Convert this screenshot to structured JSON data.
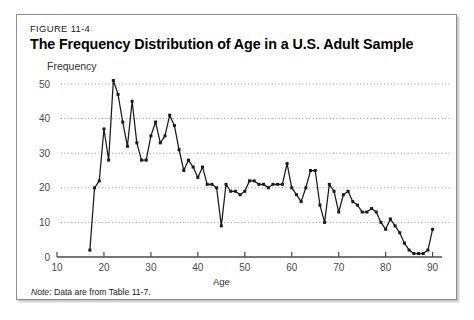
{
  "figure": {
    "number": "FIGURE 11-4",
    "title": "The Frequency Distribution of Age in a U.S. Adult Sample",
    "note_label": "Note:",
    "note_text": " Data are from Table 11-7."
  },
  "chart_data": {
    "type": "line",
    "title": "The Frequency Distribution of Age in a U.S. Adult Sample",
    "xlabel": "Age",
    "ylabel": "Frequency",
    "xlim": [
      10,
      92
    ],
    "ylim": [
      0,
      53
    ],
    "xticks": [
      10,
      20,
      30,
      40,
      50,
      60,
      70,
      80,
      90
    ],
    "yticks": [
      0,
      10,
      20,
      30,
      40,
      50
    ],
    "grid": "horizontal-dotted",
    "legend": "none",
    "marker": "filled-square",
    "line_color": "#1a1a1a",
    "x": [
      17,
      18,
      19,
      20,
      21,
      22,
      23,
      24,
      25,
      26,
      27,
      28,
      29,
      30,
      31,
      32,
      33,
      34,
      35,
      36,
      37,
      38,
      39,
      40,
      41,
      42,
      43,
      44,
      45,
      46,
      47,
      48,
      49,
      50,
      51,
      52,
      53,
      54,
      55,
      56,
      57,
      58,
      59,
      60,
      61,
      62,
      63,
      64,
      65,
      66,
      67,
      68,
      69,
      70,
      71,
      72,
      73,
      74,
      75,
      76,
      77,
      78,
      79,
      80,
      81,
      82,
      83,
      84,
      85,
      86,
      87,
      88,
      89,
      90
    ],
    "values": [
      2,
      20,
      22,
      37,
      28,
      51,
      47,
      39,
      32,
      45,
      33,
      28,
      28,
      35,
      39,
      33,
      35,
      41,
      38,
      31,
      25,
      28,
      26,
      23,
      26,
      21,
      21,
      20,
      9,
      21,
      19,
      19,
      18,
      19,
      22,
      22,
      21,
      21,
      20,
      21,
      21,
      21,
      27,
      20,
      18,
      16,
      20,
      25,
      25,
      15,
      10,
      21,
      19,
      13,
      18,
      19,
      16,
      15,
      13,
      13,
      14,
      13,
      10,
      8,
      11,
      9,
      7,
      4,
      2,
      1,
      1,
      1,
      2,
      8
    ],
    "annotations": [
      "Note: Data are from Table 11-7."
    ]
  }
}
